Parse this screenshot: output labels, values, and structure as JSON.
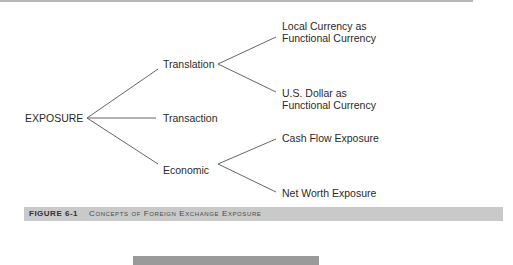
{
  "diagram": {
    "root": "EXPOSURE",
    "branches": [
      {
        "label": "Translation",
        "children": [
          "Local Currency as Functional Currency",
          "U.S. Dollar as Functional Currency"
        ]
      },
      {
        "label": "Transaction",
        "children": []
      },
      {
        "label": "Economic",
        "children": [
          "Cash Flow Exposure",
          "Net Worth Exposure"
        ]
      }
    ],
    "labels": {
      "root": "EXPOSURE",
      "translation": "Translation",
      "transaction": "Transaction",
      "economic": "Economic",
      "local_line1": "Local Currency as",
      "local_line2": "Functional Currency",
      "usd_line1": "U.S. Dollar as",
      "usd_line2": "Functional Currency",
      "cash_flow": "Cash Flow Exposure",
      "net_worth": "Net Worth Exposure"
    }
  },
  "caption": {
    "number": "FIGURE 6-1",
    "title": "Concepts of Foreign Exchange Exposure"
  },
  "colors": {
    "line": "#555555",
    "caption_bar": "#c9c9c9",
    "bottom_bar": "#9a9a9a"
  }
}
